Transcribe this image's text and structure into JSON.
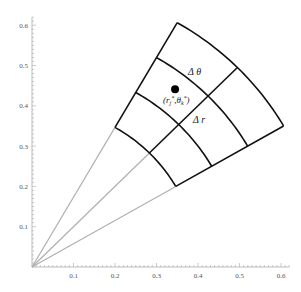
{
  "diagram": {
    "axes": {
      "x_ticks": [
        "0.1",
        "0.2",
        "0.3",
        "0.4",
        "0.5",
        "0.6"
      ],
      "x_tick_values": [
        0.1,
        0.2,
        0.3,
        0.4,
        0.5,
        0.6
      ],
      "y_ticks": [
        "0.1",
        "0.2",
        "0.3",
        "0.4",
        "0.5",
        "0.6"
      ],
      "y_tick_values": [
        0.1,
        0.2,
        0.3,
        0.4,
        0.5,
        0.6
      ],
      "xlim": [
        0,
        0.62
      ],
      "ylim": [
        0,
        0.62
      ]
    },
    "grid": {
      "radii": [
        0.4,
        0.5,
        0.6,
        0.7
      ],
      "angles_deg": [
        30,
        45,
        60
      ],
      "ray_color": "#b0b0b0",
      "grid_color": "#111111"
    },
    "sample_point": {
      "r": 0.56,
      "theta_deg": 52,
      "label": "(r_j*, θ_k*)"
    },
    "labels": {
      "delta_theta": "Δ θ",
      "delta_r": "Δ r",
      "point_label_main": "(r",
      "point_label_j": "j",
      "point_label_star1": "*",
      "point_label_mid": ",θ",
      "point_label_k": "k",
      "point_label_star2": "*",
      "point_label_close": ")"
    }
  }
}
